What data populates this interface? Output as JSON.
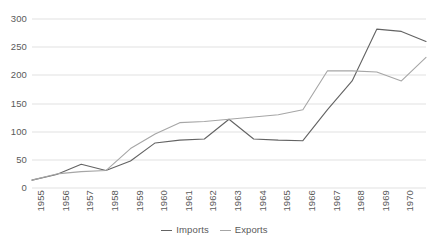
{
  "chart_data": {
    "type": "line",
    "title": "",
    "xlabel": "",
    "ylabel": "",
    "x": [
      1955,
      1956,
      1957,
      1958,
      1959,
      1960,
      1961,
      1962,
      1963,
      1964,
      1965,
      1966,
      1967,
      1968,
      1969,
      1970,
      1971
    ],
    "categories": [
      "1955",
      "1956",
      "1957",
      "1958",
      "1959",
      "1960",
      "1961",
      "1962",
      "1963",
      "1964",
      "1965",
      "1966",
      "1967",
      "1968",
      "1969",
      "1970",
      "1971"
    ],
    "series": [
      {
        "name": "Imports",
        "color": "#636363",
        "values": [
          14,
          24,
          42,
          31,
          48,
          80,
          85,
          87,
          122,
          87,
          85,
          84,
          139,
          190,
          282,
          278,
          260
        ]
      },
      {
        "name": "Exports",
        "color": "#a6a6a6",
        "values": [
          14,
          25,
          29,
          31,
          70,
          96,
          116,
          118,
          122,
          126,
          130,
          139,
          208,
          208,
          206,
          190,
          232
        ]
      }
    ],
    "ylim": [
      0,
      300
    ],
    "yticks": [
      0,
      50,
      100,
      150,
      200,
      250,
      300
    ],
    "ytick_labels": [
      "0",
      "50",
      "100",
      "150",
      "200",
      "250",
      "300"
    ],
    "grid": "horizontal",
    "legend_position": "bottom-center",
    "legend": [
      "Imports",
      "Exports"
    ]
  },
  "legend": {
    "items": [
      {
        "label": "Imports"
      },
      {
        "label": "Exports"
      }
    ]
  }
}
